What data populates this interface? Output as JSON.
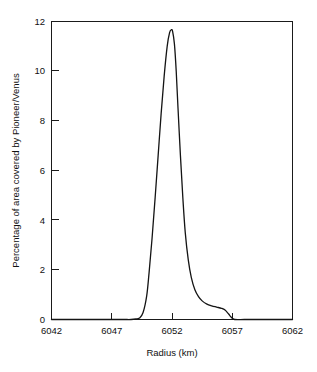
{
  "chart_data": {
    "type": "line",
    "title": "",
    "xlabel": "Radius (km)",
    "ylabel": "Percentage of area covered by Pioneer/Venus",
    "xlim": [
      6042,
      6062
    ],
    "ylim": [
      0,
      12
    ],
    "xticks": [
      6042,
      6047,
      6052,
      6057,
      6062
    ],
    "xtick_labels": [
      "6042",
      "6047",
      "6052",
      "6057",
      "6062"
    ],
    "yticks": [
      0,
      2,
      4,
      6,
      8,
      10,
      12
    ],
    "ytick_labels": [
      "0",
      "2",
      "4",
      "6",
      "8",
      "10",
      "12"
    ],
    "grid": false,
    "legend": null,
    "series": [
      {
        "name": "Pioneer/Venus hypsometric curve",
        "color": "#141414",
        "x": [
          6042.0,
          6043.0,
          6044.0,
          6045.0,
          6046.0,
          6047.0,
          6048.0,
          6048.6,
          6049.0,
          6049.3,
          6049.6,
          6049.9,
          6050.1,
          6050.35,
          6050.6,
          6050.85,
          6051.1,
          6051.35,
          6051.6,
          6051.8,
          6051.95,
          6052.05,
          6052.2,
          6052.35,
          6052.5,
          6052.7,
          6052.9,
          6053.1,
          6053.35,
          6053.6,
          6053.9,
          6054.2,
          6054.5,
          6054.9,
          6055.3,
          6055.7,
          6056.1,
          6056.4,
          6056.7,
          6056.9,
          6057.2,
          6058.0,
          6059.0,
          6060.0,
          6061.0,
          6062.0
        ],
        "y": [
          0.0,
          0.0,
          0.0,
          0.0,
          0.0,
          0.0,
          0.0,
          0.0,
          0.02,
          0.06,
          0.28,
          0.95,
          1.9,
          3.3,
          4.9,
          6.6,
          8.3,
          9.8,
          11.0,
          11.55,
          11.67,
          11.6,
          11.1,
          10.0,
          8.5,
          6.6,
          4.9,
          3.5,
          2.4,
          1.7,
          1.2,
          0.92,
          0.75,
          0.62,
          0.55,
          0.5,
          0.45,
          0.38,
          0.22,
          0.1,
          0.0,
          0.0,
          0.0,
          0.0,
          0.0,
          0.0
        ]
      }
    ],
    "annotations": {
      "peak_x": 6051.95,
      "peak_y": 11.67
    }
  },
  "figure": {
    "background_color": "#ffffff",
    "axis_color": "#1a1a1a"
  }
}
